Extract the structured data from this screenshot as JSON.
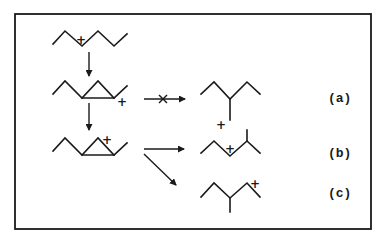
{
  "diagram": {
    "type": "carbocation rearrangement scheme",
    "charge_symbol": "+",
    "blocked_marker": "×",
    "reactant": {
      "name": "secondary carbocation",
      "charge": "+"
    },
    "intermediate_1": {
      "name": "protonated cyclopropane",
      "charge": "+"
    },
    "intermediate_2": {
      "name": "protonated cyclopropane (corner)",
      "charge": "+"
    },
    "products": [
      {
        "label": "(a)",
        "charge": "+",
        "pathway": "blocked"
      },
      {
        "label": "(b)",
        "charge": "+",
        "pathway": "allowed"
      },
      {
        "label": "(c)",
        "charge": "+",
        "pathway": "allowed"
      }
    ]
  }
}
